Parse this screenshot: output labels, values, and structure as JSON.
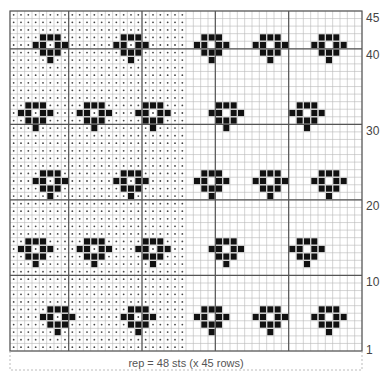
{
  "chart_title": "",
  "grid": {
    "cols": 48,
    "rows": 45,
    "dotted_cols_end": 24,
    "thick_col_lines": [
      8,
      18,
      28,
      38
    ],
    "thick_row_lines_from_top": [
      5,
      15,
      25,
      35
    ]
  },
  "row_labels": [
    {
      "label": "45",
      "row_from_top": 0
    },
    {
      "label": "40",
      "row_from_top": 5
    },
    {
      "label": "30",
      "row_from_top": 15
    },
    {
      "label": "20",
      "row_from_top": 25
    },
    {
      "label": "10",
      "row_from_top": 35
    },
    {
      "label": "1",
      "row_from_top": 44
    }
  ],
  "motif": {
    "description": "heart-shaped flower: 3 / 2+2 / 3 / 1",
    "offsets": [
      [
        0,
        -1
      ],
      [
        0,
        0
      ],
      [
        0,
        1
      ],
      [
        1,
        -2
      ],
      [
        1,
        -1
      ],
      [
        1,
        1
      ],
      [
        1,
        2
      ],
      [
        2,
        -1
      ],
      [
        2,
        0
      ],
      [
        2,
        1
      ],
      [
        3,
        0
      ]
    ]
  },
  "motif_bands": [
    {
      "top_row": 3,
      "centers": [
        5,
        16,
        27,
        35,
        43
      ]
    },
    {
      "top_row": 12,
      "centers": [
        3,
        11,
        19,
        29,
        40
      ]
    },
    {
      "top_row": 21,
      "centers": [
        5,
        16,
        27,
        35,
        43
      ]
    },
    {
      "top_row": 30,
      "centers": [
        3,
        11,
        19,
        29,
        40
      ]
    },
    {
      "top_row": 39,
      "centers": [
        6,
        17,
        27,
        35,
        43
      ]
    }
  ],
  "footer": {
    "rep_label": "rep = 48 sts (x 45 rows)"
  },
  "legend": {
    "dot_meaning": "dotted stitch",
    "filled_square_meaning": "contrast stitch"
  },
  "colors": {
    "grid_line": "#b9b9b9",
    "thick_line": "#555555",
    "border": "#555555",
    "filled": "#111111",
    "dot": "#444444",
    "dashed": "#aaaaaa"
  }
}
